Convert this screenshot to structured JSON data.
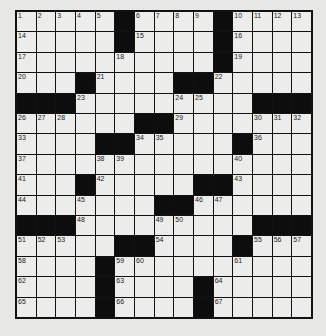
{
  "puzzle": {
    "rows": 15,
    "cols": 15,
    "colors": {
      "background": "#e7e7e5",
      "cell": "#ececea",
      "block": "#0d0d0d",
      "line": "#111111"
    },
    "layout": [
      ".....#....#....",
      ".....#....#....",
      "..........#....",
      "...#....##.....",
      "###.........###",
      "......##.......",
      "....##.....#...",
      "...............",
      "...#.....##....",
      ".......##......",
      "###.........###",
      ".....##....#...",
      "....#..........",
      "....#....#.....",
      "....#....#....."
    ],
    "numbers": [
      [
        [
          0,
          1
        ],
        [
          1,
          2
        ],
        [
          2,
          3
        ],
        [
          3,
          4
        ],
        [
          4,
          5
        ],
        [
          6,
          6
        ],
        [
          7,
          7
        ],
        [
          8,
          8
        ],
        [
          9,
          9
        ],
        [
          11,
          10
        ],
        [
          12,
          11
        ],
        [
          13,
          12
        ],
        [
          14,
          13
        ]
      ],
      [
        [
          0,
          14
        ],
        [
          6,
          15
        ],
        [
          11,
          16
        ]
      ],
      [
        [
          0,
          17
        ],
        [
          5,
          18
        ],
        [
          11,
          19
        ]
      ],
      [
        [
          0,
          20
        ],
        [
          4,
          21
        ],
        [
          10,
          22
        ]
      ],
      [
        [
          3,
          23
        ],
        [
          8,
          24
        ],
        [
          9,
          25
        ]
      ],
      [
        [
          0,
          26
        ],
        [
          1,
          27
        ],
        [
          2,
          28
        ],
        [
          8,
          29
        ],
        [
          12,
          30
        ],
        [
          13,
          31
        ],
        [
          14,
          32
        ]
      ],
      [
        [
          0,
          33
        ],
        [
          6,
          34
        ],
        [
          7,
          35
        ],
        [
          12,
          36
        ]
      ],
      [
        [
          0,
          37
        ],
        [
          4,
          38
        ],
        [
          5,
          39
        ],
        [
          11,
          40
        ]
      ],
      [
        [
          0,
          41
        ],
        [
          4,
          42
        ],
        [
          11,
          43
        ]
      ],
      [
        [
          0,
          44
        ],
        [
          3,
          45
        ],
        [
          9,
          46
        ],
        [
          10,
          47
        ]
      ],
      [
        [
          3,
          48
        ],
        [
          7,
          49
        ],
        [
          8,
          50
        ]
      ],
      [
        [
          0,
          51
        ],
        [
          1,
          52
        ],
        [
          2,
          53
        ],
        [
          7,
          54
        ],
        [
          12,
          55
        ],
        [
          13,
          56
        ],
        [
          14,
          57
        ]
      ],
      [
        [
          0,
          58
        ],
        [
          5,
          59
        ],
        [
          6,
          60
        ],
        [
          11,
          61
        ]
      ],
      [
        [
          0,
          62
        ],
        [
          5,
          63
        ],
        [
          10,
          64
        ]
      ],
      [
        [
          0,
          65
        ],
        [
          5,
          66
        ],
        [
          10,
          67
        ]
      ]
    ]
  }
}
